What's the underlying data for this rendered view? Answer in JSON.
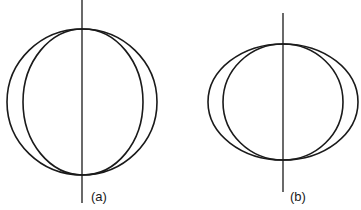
{
  "figure": {
    "panels": [
      {
        "id": "a",
        "label": "(a)",
        "description": "Two ellipses sharing a vertical axis; outer nearly circular, inner narrower",
        "axis": {
          "x": 82,
          "y1": 0,
          "y2": 203
        },
        "outer_ellipse": {
          "cx": 82,
          "cy": 102,
          "rx": 75,
          "ry": 73
        },
        "inner_ellipse": {
          "cx": 83,
          "cy": 102,
          "rx": 60,
          "ry": 73
        },
        "label_pos": {
          "x": 91,
          "y": 201
        }
      },
      {
        "id": "b",
        "label": "(b)",
        "description": "Two ellipses sharing a vertical axis; both flattened (wider than tall)",
        "axis": {
          "x": 283,
          "y1": 13,
          "y2": 192
        },
        "outer_ellipse": {
          "cx": 283,
          "cy": 102,
          "rx": 75,
          "ry": 58
        },
        "inner_ellipse": {
          "cx": 283,
          "cy": 102,
          "rx": 60,
          "ry": 58
        },
        "label_pos": {
          "x": 290,
          "y": 201
        }
      }
    ],
    "colors": {
      "line": "#1a1a1a",
      "background": "#ffffff"
    }
  }
}
